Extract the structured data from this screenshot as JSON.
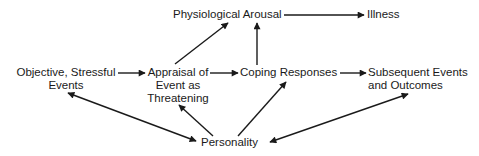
{
  "diagram": {
    "nodes": {
      "physiological_arousal": {
        "label": "Physiological Arousal"
      },
      "illness": {
        "label": "Illness"
      },
      "objective_events": {
        "line1": "Objective, Stressful",
        "line2": "Events"
      },
      "appraisal": {
        "line1": "Appraisal of",
        "line2": "Event as",
        "line3": "Threatening"
      },
      "coping": {
        "label": "Coping Responses"
      },
      "subsequent": {
        "line1": "Subsequent Events",
        "line2": "and Outcomes"
      },
      "personality": {
        "label": "Personality"
      }
    },
    "edges": [
      {
        "from": "Objective, Stressful Events",
        "to": "Appraisal of Event as Threatening",
        "type": "directed"
      },
      {
        "from": "Appraisal of Event as Threatening",
        "to": "Coping Responses",
        "type": "directed"
      },
      {
        "from": "Appraisal of Event as Threatening",
        "to": "Physiological Arousal",
        "type": "directed"
      },
      {
        "from": "Coping Responses",
        "to": "Physiological Arousal",
        "type": "directed"
      },
      {
        "from": "Physiological Arousal",
        "to": "Illness",
        "type": "directed"
      },
      {
        "from": "Coping Responses",
        "to": "Subsequent Events and Outcomes",
        "type": "directed"
      },
      {
        "from": "Personality",
        "to": "Appraisal of Event as Threatening",
        "type": "directed"
      },
      {
        "from": "Personality",
        "to": "Coping Responses",
        "type": "directed"
      },
      {
        "from": "Personality",
        "to": "Objective, Stressful Events",
        "type": "bidirectional"
      },
      {
        "from": "Personality",
        "to": "Subsequent Events and Outcomes",
        "type": "bidirectional"
      }
    ],
    "colors": {
      "ink": "#1a1a1a",
      "background": "#ffffff"
    }
  }
}
